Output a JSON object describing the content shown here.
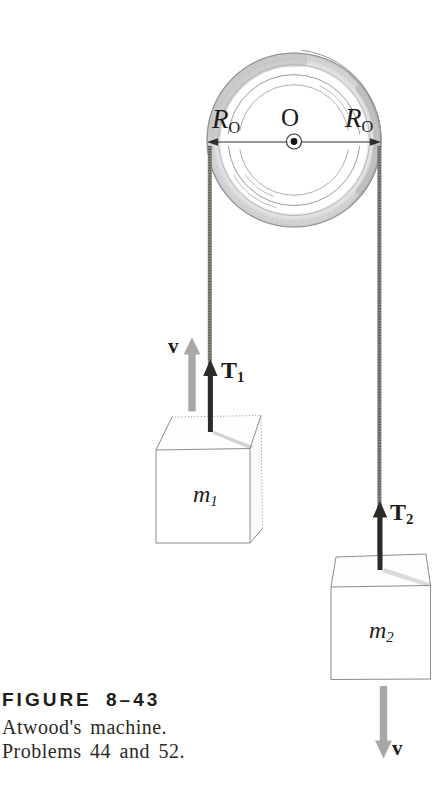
{
  "figure": {
    "pulley": {
      "axis_label": "O",
      "radius_left": {
        "main": "R",
        "sub": "O"
      },
      "radius_right": {
        "main": "R",
        "sub": "O"
      }
    },
    "left_side": {
      "velocity_label": "v",
      "tension_label": {
        "main": "T",
        "sub": "1"
      },
      "mass_label": {
        "main": "m",
        "sub": "1"
      }
    },
    "right_side": {
      "velocity_label": "v",
      "tension_label": {
        "main": "T",
        "sub": "2"
      },
      "mass_label": {
        "main": "m",
        "sub": "2"
      }
    }
  },
  "caption": {
    "figure_number": "FIGURE 8–43",
    "line1": "Atwood's machine.",
    "line2": "Problems 44 and 52."
  },
  "colors": {
    "tension_arrow": "#2e2a26",
    "velocity_arrow": "#a9a7a3",
    "outline": "#8c8c8c",
    "rope": "#8a8478",
    "text": "#1d1b19"
  }
}
